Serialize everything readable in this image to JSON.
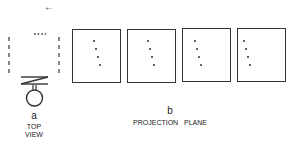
{
  "panel_a": {
    "letter": "a",
    "caption_line1": "TOP",
    "caption_line2": "VIEW",
    "arrow": "←"
  },
  "panel_b": {
    "letter": "b",
    "caption": "PROJECTION   PLANE",
    "frames": [
      {
        "dots": [
          [
            20,
            10
          ],
          [
            22,
            18
          ],
          [
            24,
            26
          ],
          [
            26,
            34
          ]
        ]
      },
      {
        "dots": [
          [
            19,
            10
          ],
          [
            21,
            18
          ],
          [
            23,
            26
          ],
          [
            25,
            34
          ]
        ]
      },
      {
        "dots": [
          [
            11,
            11
          ],
          [
            13,
            19
          ],
          [
            15,
            27
          ],
          [
            17,
            35
          ]
        ]
      },
      {
        "dots": [
          [
            5,
            11
          ],
          [
            7,
            19
          ],
          [
            9,
            27
          ],
          [
            11,
            35
          ]
        ]
      }
    ]
  },
  "colors": {
    "ink": "#333333",
    "background": "#ffffff"
  }
}
